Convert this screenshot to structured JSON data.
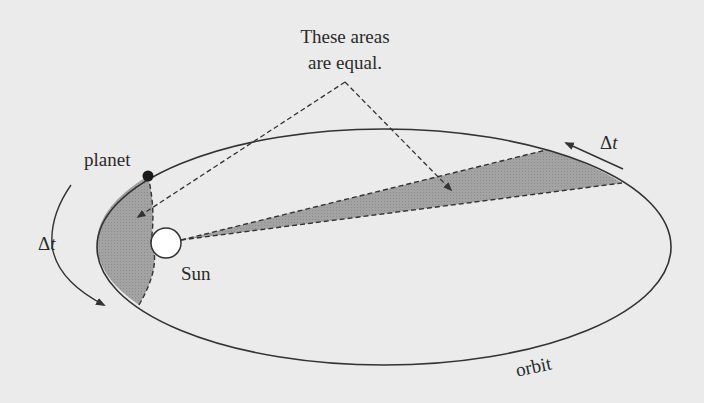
{
  "diagram": {
    "title_line1": "These areas",
    "title_line2": "are equal.",
    "labels": {
      "planet": "planet",
      "sun": "Sun",
      "orbit": "orbit",
      "delta_t_left_symbol": "Δ",
      "delta_t_left_var": "t",
      "delta_t_right_symbol": "Δ",
      "delta_t_right_var": "t"
    },
    "colors": {
      "background": "#ebebeb",
      "stroke": "#333333",
      "shaded_area": "#9a9a9a",
      "planet": "#1a1a1a",
      "sun_fill": "#ffffff"
    },
    "concept": "Kepler's second law: equal areas swept in equal time intervals"
  }
}
